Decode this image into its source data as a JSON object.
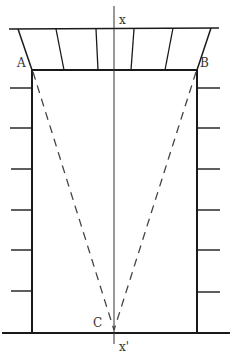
{
  "diagram": {
    "type": "structural-section",
    "labels": {
      "A": "A",
      "B": "B",
      "C": "C",
      "x_top": "x",
      "x_bottom": "x'"
    },
    "colors": {
      "line": "#1a1a1a",
      "dashed": "#444444",
      "background": "#ffffff"
    },
    "points": {
      "A": [
        32,
        70
      ],
      "B": [
        197,
        70
      ],
      "C": [
        114,
        333
      ]
    },
    "wall_ticks_y": [
      88,
      128,
      169,
      210,
      250,
      291
    ]
  }
}
